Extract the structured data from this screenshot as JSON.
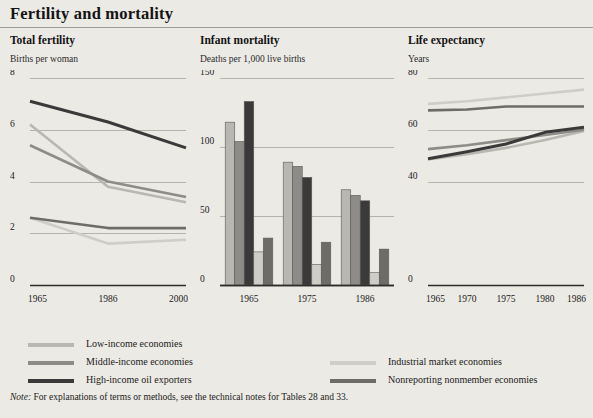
{
  "header": {
    "title": "Fertility and mortality"
  },
  "note": {
    "prefix": "Note:",
    "text": "For explanations of terms or methods, see the technical notes for Tables 28 and 33."
  },
  "series_colors": {
    "low_income": "#b9b7b2",
    "middle_income": "#8e8c88",
    "high_income_oil": "#3a3a3a",
    "industrial_market": "#cfcdc8",
    "nonreporting": "#6e6c68"
  },
  "legend": {
    "items": [
      {
        "key": "low_income",
        "label": "Low-income economies",
        "color": "#b9b7b2",
        "col": 0,
        "row": 0
      },
      {
        "key": "middle_income",
        "label": "Middle-income economies",
        "color": "#8e8c88",
        "col": 0,
        "row": 1
      },
      {
        "key": "high_income_oil",
        "label": "High-income oil exporters",
        "color": "#3a3a3a",
        "col": 0,
        "row": 2
      },
      {
        "key": "industrial_market",
        "label": "Industrial market economies",
        "color": "#cfcdc8",
        "col": 1,
        "row": 1
      },
      {
        "key": "nonreporting",
        "label": "Nonreporting nonmember economies",
        "color": "#6e6c68",
        "col": 1,
        "row": 2
      }
    ]
  },
  "chart_data": [
    {
      "id": "total-fertility",
      "type": "line",
      "title": "Total fertility",
      "subtitle": "Births per woman",
      "ylabel": "Births per woman",
      "xlabel": "",
      "x": [
        1965,
        1986,
        2000
      ],
      "xticklabels": [
        "1965",
        "1986",
        "2000"
      ],
      "ylim": [
        0,
        8
      ],
      "yticks": [
        0,
        2,
        4,
        6,
        8
      ],
      "yticklabels": [
        "0",
        "2",
        "4",
        "6",
        "8"
      ],
      "grid": true,
      "series": [
        {
          "name": "Low-income economies",
          "key": "low_income",
          "color": "#b9b7b2",
          "values": [
            6.2,
            3.8,
            3.2
          ]
        },
        {
          "name": "Middle-income economies",
          "key": "middle_income",
          "color": "#8e8c88",
          "values": [
            5.4,
            4.0,
            3.4
          ]
        },
        {
          "name": "High-income oil exporters",
          "key": "high_income_oil",
          "color": "#3a3a3a",
          "values": [
            7.1,
            6.3,
            5.3
          ]
        },
        {
          "name": "Industrial market economies",
          "key": "industrial_market",
          "color": "#cfcdc8",
          "values": [
            2.6,
            1.6,
            1.75
          ]
        },
        {
          "name": "Nonreporting nonmember economies",
          "key": "nonreporting",
          "color": "#6e6c68",
          "values": [
            2.6,
            2.2,
            2.2
          ]
        }
      ]
    },
    {
      "id": "infant-mortality",
      "type": "bar",
      "title": "Infant mortality",
      "subtitle": "Deaths per 1,000 live births",
      "ylabel": "Deaths per 1,000 live births",
      "xlabel": "",
      "categories": [
        "1965",
        "1975",
        "1986"
      ],
      "ylim": [
        0,
        150
      ],
      "yticks": [
        0,
        50,
        100,
        150
      ],
      "yticklabels": [
        "0",
        "50",
        "100",
        "150"
      ],
      "grid": true,
      "series": [
        {
          "name": "Low-income economies",
          "key": "low_income",
          "color": "#b9b7b2",
          "values": [
            118,
            89,
            69
          ]
        },
        {
          "name": "Middle-income economies",
          "key": "middle_income",
          "color": "#8e8c88",
          "values": [
            104,
            86,
            65
          ]
        },
        {
          "name": "High-income oil exporters",
          "key": "high_income_oil",
          "color": "#3a3a3a",
          "values": [
            133,
            78,
            61
          ]
        },
        {
          "name": "Industrial market economies",
          "key": "industrial_market",
          "color": "#cfcdc8",
          "values": [
            24,
            15,
            9
          ]
        },
        {
          "name": "Nonreporting nonmember economies",
          "key": "nonreporting",
          "color": "#6e6c68",
          "values": [
            34,
            31,
            26
          ]
        }
      ]
    },
    {
      "id": "life-expectancy",
      "type": "line",
      "title": "Life expectancy",
      "subtitle": "Years",
      "ylabel": "Years",
      "xlabel": "",
      "x": [
        1965,
        1970,
        1975,
        1980,
        1986
      ],
      "xticklabels": [
        "1965",
        "1970",
        "1975",
        "1980",
        "1986"
      ],
      "ylim": [
        0,
        80
      ],
      "yticks": [
        0,
        40,
        60,
        80
      ],
      "yticklabels": [
        "0",
        "40",
        "60",
        "80"
      ],
      "grid": true,
      "series": [
        {
          "name": "Low-income economies",
          "key": "low_income",
          "color": "#b9b7b2",
          "values": [
            48.5,
            50.5,
            53.0,
            56.0,
            59.5
          ]
        },
        {
          "name": "Middle-income economies",
          "key": "middle_income",
          "color": "#8e8c88",
          "values": [
            52.5,
            54.0,
            56.0,
            58.0,
            60.0
          ]
        },
        {
          "name": "High-income oil exporters",
          "key": "high_income_oil",
          "color": "#3a3a3a",
          "values": [
            48.8,
            51.5,
            54.5,
            59.0,
            61.0
          ]
        },
        {
          "name": "Industrial market economies",
          "key": "industrial_market",
          "color": "#cfcdc8",
          "values": [
            70.0,
            71.0,
            72.5,
            74.0,
            75.5
          ]
        },
        {
          "name": "Nonreporting nonmember economies",
          "key": "nonreporting",
          "color": "#6e6c68",
          "values": [
            67.5,
            67.8,
            69.0,
            69.0,
            69.0
          ]
        }
      ]
    }
  ],
  "panels_layout": [
    {
      "id": "total-fertility",
      "left": 10,
      "width": 178
    },
    {
      "id": "infant-mortality",
      "left": 200,
      "width": 196
    },
    {
      "id": "life-expectancy",
      "left": 408,
      "width": 178
    }
  ]
}
